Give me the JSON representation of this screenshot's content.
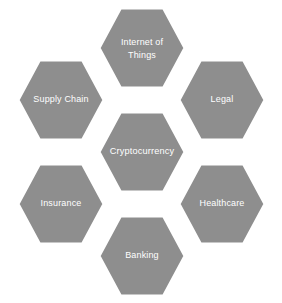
{
  "diagram": {
    "type": "honeycomb-hexagon-cluster",
    "colors": {
      "hex_fill": "#8e8e8e",
      "hex_stroke": "#ffffff",
      "label_text": "#ffffff",
      "background": "#ffffff"
    },
    "geometry": {
      "hex_width": 86,
      "hex_height": 80,
      "columns": 3,
      "total_cells": 7
    },
    "center": {
      "label": "Cryptocurrency",
      "cx": 142,
      "cy": 152,
      "lines": [
        "Cryptocurrency"
      ]
    },
    "nodes": [
      {
        "id": "internet-of-things",
        "label": "Internet of Things",
        "lines": [
          "Internet of",
          "Things"
        ],
        "cx": 142,
        "cy": 48,
        "position": "top"
      },
      {
        "id": "supply-chain",
        "label": "Supply Chain",
        "lines": [
          "Supply Chain"
        ],
        "cx": 61,
        "cy": 100,
        "position": "top-left"
      },
      {
        "id": "legal",
        "label": "Legal",
        "lines": [
          "Legal"
        ],
        "cx": 222,
        "cy": 100,
        "position": "top-right"
      },
      {
        "id": "insurance",
        "label": "Insurance",
        "lines": [
          "Insurance"
        ],
        "cx": 61,
        "cy": 204,
        "position": "bottom-left"
      },
      {
        "id": "healthcare",
        "label": "Healthcare",
        "lines": [
          "Healthcare"
        ],
        "cx": 222,
        "cy": 204,
        "position": "bottom-right"
      },
      {
        "id": "banking",
        "label": "Banking",
        "lines": [
          "Banking"
        ],
        "cx": 142,
        "cy": 256,
        "position": "bottom"
      }
    ]
  }
}
